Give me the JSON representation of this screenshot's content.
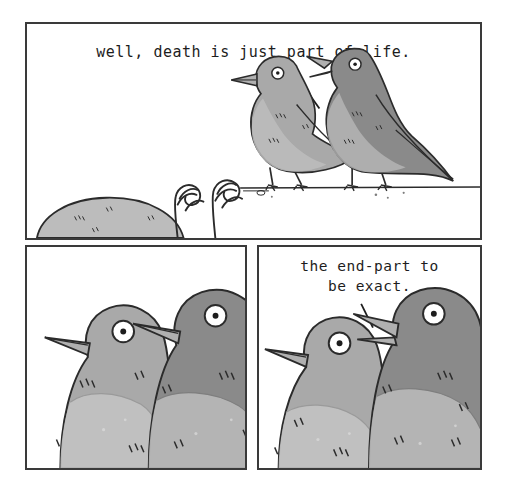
{
  "comic": {
    "title": "well, death is just part of life.",
    "panel_count": 3,
    "background_color": "#ffffff",
    "border_color": "#3a3a3a",
    "ink_color": "#1d1d1d"
  },
  "palette": {
    "bird_light_body": "#a9a9a9",
    "bird_light_belly": "#bdbdbd",
    "bird_dark_body": "#8a8a8a",
    "bird_dark_belly": "#b6b6b6",
    "beak": "#b0b0b0",
    "eye_white": "#ffffff",
    "eye_pupil": "#1d1d1d",
    "mound": "#bcbcbc",
    "outline": "#2b2b2b"
  },
  "panels": [
    {
      "id": "panel-1",
      "name": "panel-wide-two-birds-on-branch",
      "caption": "well, death is just part of life.",
      "speaker": "right-bird",
      "elements": [
        "speech-pointer-line",
        "left-bird-light",
        "right-bird-dark-speaking",
        "ground-line",
        "mound",
        "fern-left",
        "fern-right"
      ]
    },
    {
      "id": "panel-2",
      "name": "panel-closeup-silent",
      "caption": "",
      "speaker": "none",
      "elements": [
        "left-bird-light-closeup",
        "right-bird-dark-closeup"
      ]
    },
    {
      "id": "panel-3",
      "name": "panel-closeup-speaking",
      "caption": "the end-part to\nbe exact.",
      "speaker": "right-bird",
      "elements": [
        "speech-pointer-line",
        "left-bird-light-closeup",
        "right-bird-dark-closeup-speaking"
      ]
    }
  ]
}
